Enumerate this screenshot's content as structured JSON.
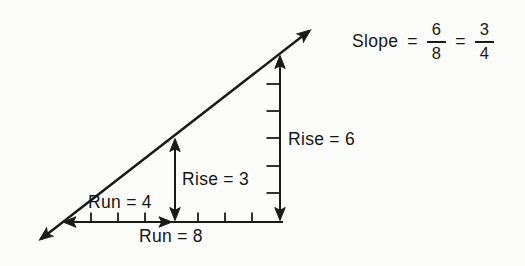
{
  "figure": {
    "equation": {
      "label": "Slope",
      "equals1": "=",
      "fraction1": {
        "numerator": "6",
        "denominator": "8"
      },
      "equals2": "=",
      "fraction2": {
        "numerator": "3",
        "denominator": "4"
      }
    },
    "labels": {
      "rise_inner": "Rise = 3",
      "rise_outer": "Rise = 6",
      "run_inner": "Run = 4",
      "run_outer": "Run = 8"
    },
    "measurements": {
      "rise_inner": 3,
      "run_inner": 4,
      "rise_outer": 6,
      "run_outer": 8,
      "slope_fraction": "6/8",
      "slope_simplified": "3/4"
    },
    "colors": {
      "ink": "#1a1a1a",
      "background": "#fcfcfb"
    }
  }
}
